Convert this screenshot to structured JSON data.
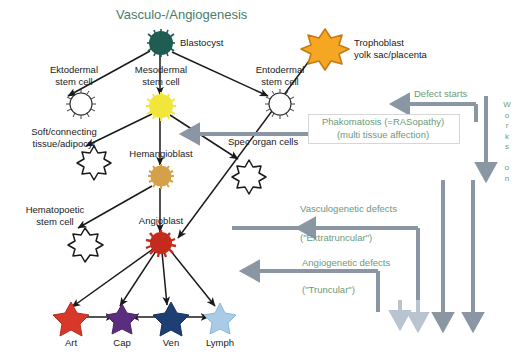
{
  "title": "Vasculo-/Angiogenesis",
  "colors": {
    "title_green": "#4a7c6a",
    "label_green": "#6b9a7a",
    "arrow_gray": "#8a96a3",
    "arrow_gray_light": "#b9c4d0",
    "blastocyst": "#1f5c52",
    "mesodermal": "#f2e63a",
    "hemangioblast": "#d4a04a",
    "angioblast": "#c42b1c",
    "trophoblast": "#f5a623",
    "art": "#d8382a",
    "cap": "#5b2d7e",
    "ven": "#1d3f73",
    "lymph": "#a8cbe8",
    "black": "#1a1a1a"
  },
  "nodes": [
    {
      "id": "blastocyst",
      "label": "Blastocyst",
      "shape": "starburst",
      "fill": "#1f5c52",
      "stroke": "#17463e"
    },
    {
      "id": "ektodermal",
      "label": "Ektodermal\nstem cell",
      "shape": "fuzzy",
      "fill": "#ffffff",
      "stroke": "#1a1a1a"
    },
    {
      "id": "mesodermal",
      "label": "Mesodermal\nstem cell",
      "shape": "starburst",
      "fill": "#f2e63a",
      "stroke": "#ded02f"
    },
    {
      "id": "entodermal",
      "label": "Entodermal\nstem cell",
      "shape": "fuzzy",
      "fill": "#ffffff",
      "stroke": "#1a1a1a"
    },
    {
      "id": "trophoblast",
      "label": "Trophoblast\nyolk sac/placenta",
      "shape": "star8",
      "fill": "#f5a623",
      "stroke": "#c77a12"
    },
    {
      "id": "soft",
      "label": "Soft/connecting\ntissue/adipocyt",
      "shape": "starburst",
      "fill": "#ffffff",
      "stroke": "#1a1a1a"
    },
    {
      "id": "specorgan",
      "label": "Spec organ cells",
      "shape": "starburst",
      "fill": "#ffffff",
      "stroke": "#1a1a1a"
    },
    {
      "id": "hemangioblast",
      "label": "Hemangioblast",
      "shape": "starburst",
      "fill": "#d4a04a",
      "stroke": "#b8853a"
    },
    {
      "id": "hematopoetic",
      "label": "Hematopoetic\nstem cell",
      "shape": "starburst",
      "fill": "#ffffff",
      "stroke": "#1a1a1a"
    },
    {
      "id": "angioblast",
      "label": "Angioblast",
      "shape": "starburst",
      "fill": "#c42b1c",
      "stroke": "#a01f12"
    },
    {
      "id": "art",
      "label": "Art",
      "shape": "star5",
      "fill": "#d8382a",
      "stroke": "#b72b1e"
    },
    {
      "id": "cap",
      "label": "Cap",
      "shape": "star5",
      "fill": "#5b2d7e",
      "stroke": "#4a2367"
    },
    {
      "id": "ven",
      "label": "Ven",
      "shape": "star5",
      "fill": "#1d3f73",
      "stroke": "#16305a"
    },
    {
      "id": "lymph",
      "label": "Lymph",
      "shape": "star5",
      "fill": "#a8cbe8",
      "stroke": "#8fb7d8"
    }
  ],
  "labels": {
    "blastocyst": "Blastocyst",
    "ektodermal_l1": "Ektodermal",
    "ektodermal_l2": "stem cell",
    "mesodermal_l1": "Mesodermal",
    "mesodermal_l2": "stem cell",
    "entodermal_l1": "Entodermal",
    "entodermal_l2": "stem cell",
    "trophoblast_l1": "Trophoblast",
    "trophoblast_l2": "yolk sac/placenta",
    "soft_l1": "Soft/connecting",
    "soft_l2": "tissue/adipocyt",
    "specorgan": "Spec organ cells",
    "hemangioblast": "Hemangioblast",
    "hematopoetic_l1": "Hematopoetic",
    "hematopoetic_l2": "stem cell",
    "angioblast": "Angioblast",
    "art": "Art",
    "cap": "Cap",
    "ven": "Ven",
    "lymph": "Lymph"
  },
  "annotations": {
    "defect_starts": "Defect starts",
    "works_on": "Works on",
    "works_on_letters": [
      "W",
      "o",
      "r",
      "k",
      "s",
      "",
      "o",
      "n"
    ],
    "phakomatosis_l1": "Phakomatosis (=RASopathy)",
    "phakomatosis_l2": "(multi tissue affection)",
    "vasculogenetic_l1": "Vasculogenetic defects",
    "vasculogenetic_l2": "(\"Extratruncular\")",
    "angiogenetic_l1": "Angiogenetic defects",
    "angiogenetic_l2": "(\"Truncular\")"
  }
}
